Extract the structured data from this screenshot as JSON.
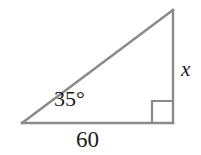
{
  "figure": {
    "kind": "right-triangle-diagram",
    "background_color": "#ffffff",
    "stroke_color": "#8a8a8a",
    "text_color": "#1a1a1a",
    "stroke_width": 2,
    "angle_label": "35°",
    "base_label": "60",
    "vertical_label": "x",
    "right_angle_marker": "square",
    "vertices": {
      "bottom_left": {
        "x": 22,
        "y": 123
      },
      "bottom_right": {
        "x": 173,
        "y": 123
      },
      "apex": {
        "x": 173,
        "y": 10
      }
    },
    "right_angle_square": {
      "x": 152,
      "y": 100,
      "size": 22
    },
    "labels": {
      "angle": {
        "text": "35°",
        "x": 54,
        "y": 88
      },
      "base": {
        "text": "60",
        "x": 76,
        "y": 128
      },
      "vertical": {
        "text": "x",
        "x": 181,
        "y": 59
      }
    }
  }
}
